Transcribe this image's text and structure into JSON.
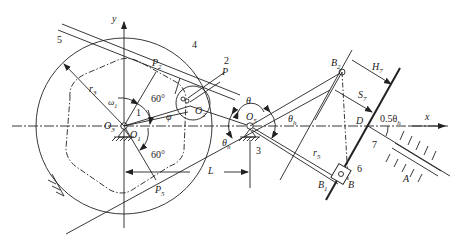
{
  "figure": {
    "type": "mechanism-kinematic-diagram",
    "axes": {
      "x_label": "x",
      "y_label": "y"
    },
    "labels": {
      "link_5": "5",
      "link_4": "4",
      "link_2": "2",
      "point_P": "P",
      "point_P2": "P",
      "point_P2_sub": "2",
      "point_P5": "P",
      "point_P5_sub": "5",
      "r3": "r",
      "r3_sub": "3",
      "omega1": "ω",
      "omega1_sub": "1",
      "link_1": "1",
      "angle_60_top": "60°",
      "angle_60_bottom": "60°",
      "phi": "φ",
      "O3": "O",
      "O3_sub": "3",
      "O1": "O",
      "O1_sub": "1",
      "O2": "O",
      "O2_sub": "2",
      "theta": "θ",
      "O5": "O",
      "O5_sub": "5",
      "theta_h_right": "θ",
      "theta_h_right_sub": "h",
      "theta_h_left": "θ",
      "theta_h_left_sub": "h",
      "link_3": "3",
      "L": "L",
      "B2": "B",
      "B2_sub": "2",
      "H7": "H",
      "H7_sub": "7",
      "S7": "S",
      "S7_sub": "7",
      "D": "D",
      "half_theta_h": "0.5θ",
      "half_theta_h_sub": "h",
      "r5": "r",
      "r5_sub": "5",
      "link_6": "6",
      "link_7": "7",
      "B1": "B",
      "B1_sub": "1",
      "B": "B",
      "A": "A"
    },
    "colors": {
      "stroke": "#222222",
      "background": "#ffffff"
    }
  }
}
